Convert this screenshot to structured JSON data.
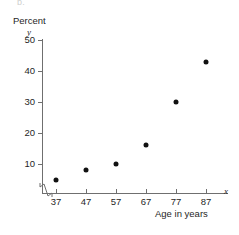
{
  "figure": {
    "part_label": "b.",
    "y_axis_title": "Percent",
    "y_axis_variable": "y",
    "x_axis_variable": "x",
    "x_axis_title": "Age in years"
  },
  "chart_data": {
    "type": "scatter",
    "title": "",
    "xlabel": "Age in years",
    "ylabel": "Percent",
    "x": [
      37,
      47,
      57,
      67,
      77,
      87
    ],
    "values": [
      5,
      8,
      10,
      16,
      30,
      43
    ],
    "points": [
      {
        "x": 37,
        "y": 5
      },
      {
        "x": 47,
        "y": 8
      },
      {
        "x": 57,
        "y": 10
      },
      {
        "x": 67,
        "y": 16
      },
      {
        "x": 77,
        "y": 30
      },
      {
        "x": 87,
        "y": 43
      }
    ],
    "x_ticks": [
      37,
      47,
      57,
      67,
      77,
      87
    ],
    "y_ticks": [
      10,
      20,
      30,
      40,
      50
    ],
    "xlim": [
      32,
      92
    ],
    "ylim": [
      0,
      50
    ],
    "grid": false,
    "legend": null,
    "x_axis_broken": true,
    "marker_color": "#111111",
    "axis_color": "#6f6f6f"
  }
}
